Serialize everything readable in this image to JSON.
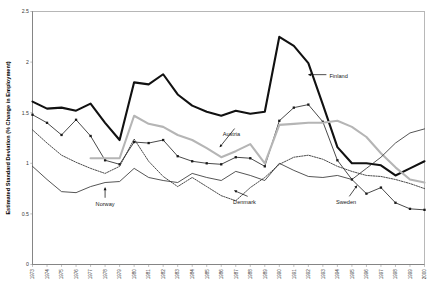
{
  "chart_data": {
    "type": "line",
    "title": "",
    "xlabel": "",
    "ylabel": "Estimated Standard Deviation (% Change in Employment)",
    "ylim": [
      0,
      2.5
    ],
    "yticks": [
      0,
      0.5,
      1,
      1.5,
      2,
      2.5
    ],
    "ytick_labels": [
      "0",
      "0.5",
      "1",
      "1.5",
      "2",
      "2.5"
    ],
    "grid": true,
    "legend_position": "inline-annotations",
    "x": [
      1973,
      1974,
      1975,
      1976,
      1977,
      1978,
      1979,
      1980,
      1981,
      1982,
      1983,
      1984,
      1985,
      1986,
      1987,
      1988,
      1989,
      1990,
      1991,
      1992,
      1993,
      1994,
      1995,
      1996,
      1997,
      1998,
      1999,
      2000
    ],
    "categories": [
      "1973",
      "1974",
      "1975",
      "1976",
      "1977",
      "1978",
      "1979",
      "1980",
      "1981",
      "1982",
      "1983",
      "1984",
      "1985",
      "1986",
      "1987",
      "1988",
      "1989",
      "1990",
      "1991",
      "1992",
      "1993",
      "1994",
      "1995",
      "1996",
      "1997",
      "1998",
      "1999",
      "2000"
    ],
    "series": [
      {
        "name": "Finland",
        "style": "thick-black",
        "color": "#111111",
        "width": 2.1,
        "dash": "",
        "markers": false,
        "values": [
          1.61,
          1.54,
          1.55,
          1.52,
          1.59,
          1.4,
          1.23,
          1.8,
          1.78,
          1.88,
          1.68,
          1.57,
          1.51,
          1.47,
          1.52,
          1.49,
          1.51,
          2.25,
          2.16,
          1.99,
          1.58,
          1.16,
          1.0,
          1.0,
          0.98,
          0.88,
          0.95,
          1.02
        ]
      },
      {
        "name": "Sweden",
        "style": "black-markers",
        "color": "#1a1a1a",
        "width": 0.8,
        "dash": "",
        "markers": true,
        "values": [
          1.48,
          1.4,
          1.28,
          1.43,
          1.27,
          1.03,
          0.99,
          1.21,
          1.2,
          1.23,
          1.07,
          1.02,
          1.0,
          0.99,
          1.06,
          1.05,
          0.97,
          1.42,
          1.55,
          1.58,
          1.41,
          1.03,
          0.84,
          0.7,
          0.76,
          0.61,
          0.55,
          0.54
        ]
      },
      {
        "name": "Austria",
        "style": "thick-gray",
        "color": "#b5b5b5",
        "width": 2.1,
        "dash": "",
        "markers": false,
        "values": [
          null,
          null,
          null,
          null,
          1.05,
          1.05,
          1.05,
          1.47,
          1.39,
          1.36,
          1.28,
          1.23,
          1.15,
          1.06,
          1.12,
          1.19,
          1.0,
          1.38,
          1.39,
          1.4,
          1.4,
          1.42,
          1.36,
          1.26,
          1.1,
          0.96,
          0.84,
          0.81
        ]
      },
      {
        "name": "Denmark",
        "style": "dotted",
        "color": "#2a2a2a",
        "width": 0.85,
        "dash": "1.4,1.2",
        "markers": false,
        "values": [
          1.33,
          1.2,
          1.08,
          1.01,
          0.95,
          0.9,
          0.97,
          1.24,
          1.02,
          0.87,
          0.77,
          0.86,
          0.77,
          0.68,
          0.63,
          0.76,
          0.86,
          0.99,
          1.06,
          1.08,
          1.04,
          0.97,
          0.92,
          0.88,
          0.87,
          0.84,
          0.8,
          0.75
        ]
      },
      {
        "name": "Norway",
        "style": "thin-black",
        "color": "#2a2a2a",
        "width": 0.8,
        "dash": "",
        "markers": false,
        "values": [
          0.97,
          0.84,
          0.72,
          0.71,
          0.77,
          0.81,
          0.82,
          0.95,
          0.86,
          0.83,
          0.81,
          0.9,
          0.86,
          0.83,
          0.92,
          0.88,
          0.83,
          1.0,
          0.93,
          0.87,
          0.86,
          0.88,
          0.84,
          0.95,
          1.06,
          1.2,
          1.3,
          1.34
        ]
      }
    ],
    "annotations": [
      {
        "name": "Finland",
        "label": "Finland",
        "x": 1993.45,
        "y": 1.86,
        "arrow": "left",
        "tail_x": 1992.0,
        "tail_y": 1.86
      },
      {
        "name": "Austria",
        "label": "Austria",
        "x": 1986.7,
        "y": 1.29,
        "arrow": "down-left",
        "tail_x": 1985.9,
        "tail_y": 1.16
      },
      {
        "name": "Norway",
        "label": "Norway",
        "x": 1978.0,
        "y": 0.6,
        "arrow": "up",
        "tail_x": 1978.0,
        "tail_y": 0.76
      },
      {
        "name": "Denmark",
        "label": "Denmark",
        "x": 1987.6,
        "y": 0.62,
        "arrow": "up-right",
        "tail_x": 1986.9,
        "tail_y": 0.73
      },
      {
        "name": "Sweden",
        "label": "Sweden",
        "x": 1994.6,
        "y": 0.62,
        "arrow": "up-right",
        "tail_x": 1995.35,
        "tail_y": 0.78
      }
    ]
  }
}
